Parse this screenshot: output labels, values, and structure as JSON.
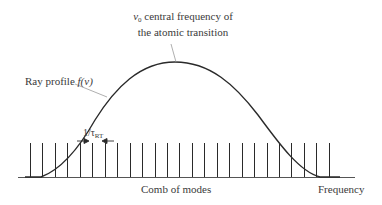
{
  "figure": {
    "type": "laser gain profile with longitudinal mode comb",
    "peak_label": {
      "symbol": "ν",
      "subscript": "0",
      "line1_rest": " central frequency of",
      "line2": "the atomic transition"
    },
    "profile_label": {
      "text": "Ray profile ",
      "func": "f(ν)"
    },
    "spacing_label": {
      "text": "1/τ",
      "subscript": "RT"
    },
    "comb_label": "Comb of modes",
    "axis_label": "Frequency",
    "comb": {
      "count": 25,
      "first_x": 30,
      "spacing": 12.45,
      "top_y": 143,
      "base_y": 177
    },
    "colors": {
      "line": "#2a2a2a",
      "leader": "#9a9a9a",
      "text": "#3a3a3a"
    }
  }
}
